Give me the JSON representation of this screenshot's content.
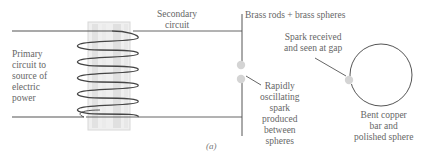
{
  "figure": {
    "caption": "(a)",
    "labels": {
      "primary": [
        "Primary",
        "circuit to",
        "source of",
        "electric",
        "power"
      ],
      "secondary": [
        "Secondary",
        "circuit"
      ],
      "brass": "Brass rods + brass spheres",
      "spark_received": [
        "Spark received",
        "and seen at gap"
      ],
      "oscillating": [
        "Rapidly",
        "oscillating",
        "spark",
        "produced",
        "between",
        "spheres"
      ],
      "copper": [
        "Bent copper",
        "bar and",
        "polished sphere"
      ]
    },
    "colors": {
      "line": "#555555",
      "coil": "#444444",
      "core": "#d9d9d9",
      "sphere": "#d0d0d0"
    }
  }
}
